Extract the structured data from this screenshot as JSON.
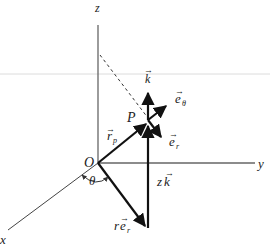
{
  "diagram": {
    "axes": {
      "x_label": "x",
      "y_label": "y",
      "z_label": "z"
    },
    "points": {
      "origin_label": "O",
      "point_label": "P"
    },
    "angle_label": "θ",
    "vectors": {
      "r_p": "r",
      "r_p_sub": "p",
      "k": "k",
      "e_theta": "e",
      "e_theta_sub": "θ",
      "e_r": "e",
      "e_r_sub": "r",
      "z_k_coef": "z",
      "z_k_vec": "k",
      "r_e_r_coef": "r",
      "r_e_r_vec": "e",
      "r_e_r_sub": "r"
    },
    "colors": {
      "axis": "#555555",
      "vector": "#111111",
      "guide_line": "#dddddd"
    }
  }
}
